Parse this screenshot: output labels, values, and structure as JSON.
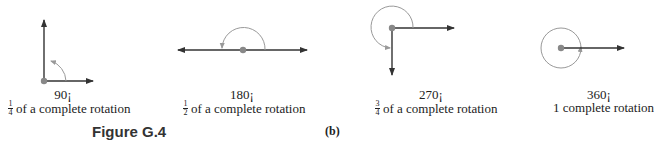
{
  "figure": {
    "title": "Figure G.4",
    "part": "(b)"
  },
  "colors": {
    "ray": "#333333",
    "arc": "#999999",
    "vertex": "#888888"
  },
  "rotations": [
    {
      "degree": "90¡",
      "numerator": "1",
      "denominator": "4",
      "description": "of a complete rotation"
    },
    {
      "degree": "180¡",
      "numerator": "1",
      "denominator": "2",
      "description": "of a complete rotation"
    },
    {
      "degree": "270¡",
      "numerator": "3",
      "denominator": "4",
      "description": "of a complete rotation"
    },
    {
      "degree": "360¡",
      "description": "1 complete rotation"
    }
  ]
}
